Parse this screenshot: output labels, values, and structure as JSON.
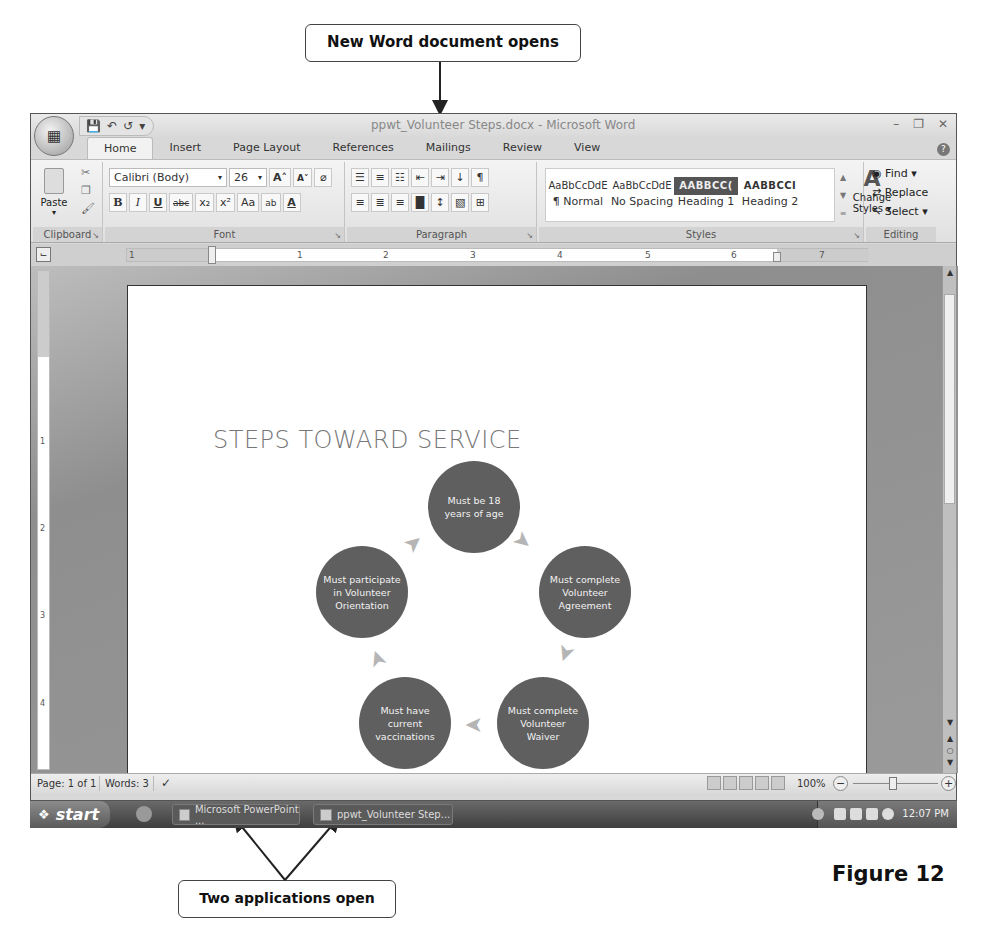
{
  "annotations": {
    "top_callout": "New Word document opens",
    "bottom_callout": "Two applications open",
    "figure_label": "Figure 12"
  },
  "window": {
    "title": "ppwt_Volunteer Steps.docx - Microsoft Word",
    "office_button_icon": "office-logo-icon",
    "quick_access": [
      "save-icon",
      "undo-icon",
      "redo-icon",
      "customize-icon"
    ],
    "controls": [
      "minimize-icon",
      "restore-icon",
      "close-icon"
    ]
  },
  "tabs": [
    {
      "label": "Home",
      "active": true
    },
    {
      "label": "Insert"
    },
    {
      "label": "Page Layout"
    },
    {
      "label": "References"
    },
    {
      "label": "Mailings"
    },
    {
      "label": "Review"
    },
    {
      "label": "View"
    }
  ],
  "ribbon": {
    "clipboard": {
      "label": "Clipboard",
      "paste": "Paste"
    },
    "font": {
      "label": "Font",
      "font_name": "Calibri (Body)",
      "font_size": "26",
      "buttons_row1": [
        "A˄",
        "A˅",
        "⌀"
      ],
      "buttons_row2": [
        "B",
        "I",
        "U",
        "abc",
        "x₂",
        "x²",
        "Aa",
        "ab",
        "A"
      ]
    },
    "paragraph": {
      "label": "Paragraph",
      "buttons_row1": [
        "☰",
        "≡",
        "☷",
        "⇤",
        "⇥",
        "↓",
        "¶"
      ],
      "buttons_row2": [
        "≡",
        "≣",
        "≡",
        "█",
        "↕",
        "▧",
        "⊞"
      ]
    },
    "styles": {
      "label": "Styles",
      "items": [
        {
          "sample": "AaBbCcDdE",
          "name": "¶ Normal",
          "kind": "normal"
        },
        {
          "sample": "AaBbCcDdE",
          "name": "No Spacing",
          "kind": "normal"
        },
        {
          "sample": "AABBCC(",
          "name": "Heading 1",
          "kind": "h1"
        },
        {
          "sample": "AABBCCI",
          "name": "Heading 2",
          "kind": "h2"
        }
      ],
      "change_styles": "Change Styles ▾"
    },
    "editing": {
      "label": "Editing",
      "find": "Find ▾",
      "replace": "Replace",
      "select": "Select ▾"
    }
  },
  "ruler": {
    "numbers": [
      "1",
      "1",
      "2",
      "3",
      "4",
      "5",
      "6",
      "7"
    ],
    "vertical_numbers": [
      "1",
      "2",
      "3",
      "4"
    ]
  },
  "document": {
    "title": "STEPS TOWARD SERVICE",
    "cycle_steps": [
      "Must be 18 years of age",
      "Must complete Volunteer Agreement",
      "Must complete Volunteer Waiver",
      "Must have current vaccinations",
      "Must participate in Volunteer Orientation"
    ]
  },
  "statusbar": {
    "page": "Page: 1 of 1",
    "words": "Words: 3",
    "zoom": "100%"
  },
  "taskbar": {
    "start": "start",
    "apps": [
      "Microsoft PowerPoint ...",
      "ppwt_Volunteer Step..."
    ],
    "clock": "12:07 PM"
  }
}
